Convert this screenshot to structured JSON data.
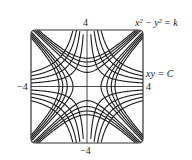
{
  "chart_data": {
    "type": "line",
    "title": "",
    "series": [
      {
        "name": "x^2 - y^2 = k",
        "family": "difference-of-squares",
        "k_values": [
          -4,
          -3,
          -2,
          -1,
          1,
          2,
          3,
          4
        ]
      },
      {
        "name": "xy = C",
        "family": "product",
        "C_values": [
          -4,
          -3,
          -2,
          -1,
          1,
          2,
          3,
          4
        ]
      }
    ],
    "xlim": [
      -4,
      4
    ],
    "ylim": [
      -4,
      4
    ],
    "tick_labels": {
      "top": "4",
      "bottom": "−4",
      "left": "−4",
      "right": "4"
    },
    "axes_visible": true,
    "grid": false,
    "annotations": [
      {
        "text": "x² − y² = k",
        "position": "top-right"
      },
      {
        "text": "xy = C",
        "position": "right"
      }
    ]
  },
  "labels": {
    "top": "4",
    "bottom": "−4",
    "left": "−4",
    "right": "4",
    "eq1": "x² − y² = k",
    "eq2": "xy = C"
  },
  "colors": {
    "curve": "#1a1a1a",
    "frame": "#333333"
  }
}
